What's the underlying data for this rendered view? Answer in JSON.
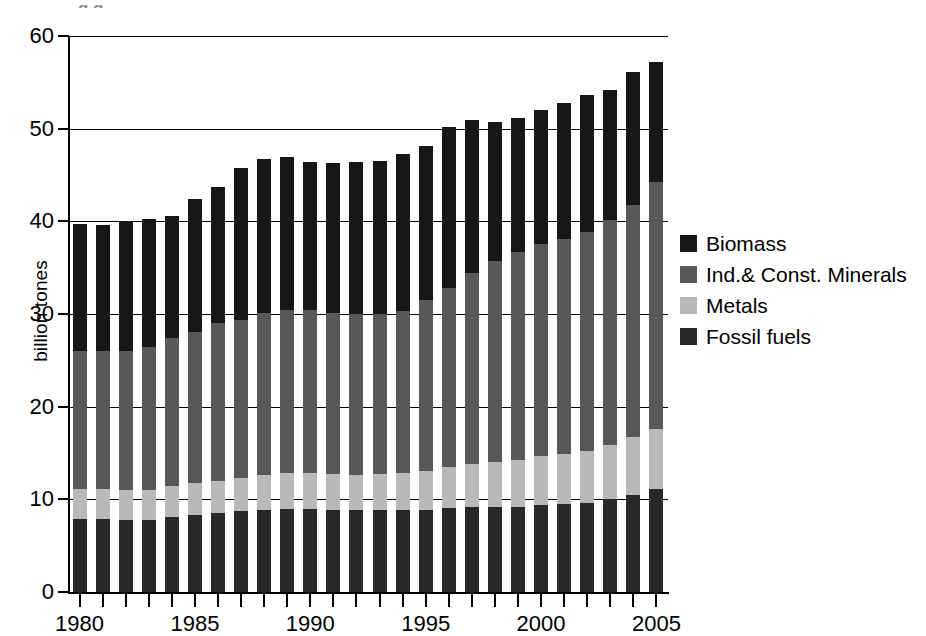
{
  "top_clipped_text": "g                                                                   g",
  "legend": {
    "position": "right",
    "items": [
      {
        "label": "Biomass",
        "color": "#171717",
        "key": "biomass"
      },
      {
        "label": "Ind.& Const. Minerals",
        "color": "#585858",
        "key": "minerals"
      },
      {
        "label": "Metals",
        "color": "#b9b9b9",
        "key": "metals"
      },
      {
        "label": "Fossil fuels",
        "color": "#282828",
        "key": "fossil"
      }
    ]
  },
  "axes": {
    "ylabel": "billion tones",
    "yticks": [
      0,
      10,
      20,
      30,
      40,
      50,
      60
    ],
    "ylim": [
      0,
      60
    ],
    "xlabels": [
      "1980",
      "1985",
      "1990",
      "1995",
      "2000",
      "2005"
    ],
    "xlabel": ""
  },
  "chart_data": {
    "type": "bar",
    "stacked": true,
    "title": "",
    "xlabel": "",
    "ylabel": "billion tones",
    "ylim": [
      0,
      60
    ],
    "grid": true,
    "legend_position": "right",
    "categories": [
      "1980",
      "1981",
      "1982",
      "1983",
      "1984",
      "1985",
      "1986",
      "1987",
      "1988",
      "1989",
      "1990",
      "1991",
      "1992",
      "1993",
      "1994",
      "1995",
      "1996",
      "1997",
      "1998",
      "1999",
      "2000",
      "2001",
      "2002",
      "2003",
      "2004",
      "2005"
    ],
    "stack_order_bottom_to_top": [
      "Fossil fuels",
      "Metals",
      "Ind.& Const. Minerals",
      "Biomass"
    ],
    "series": [
      {
        "name": "Fossil fuels",
        "color": "#282828",
        "values": [
          7.9,
          7.9,
          7.8,
          7.8,
          8.1,
          8.3,
          8.5,
          8.7,
          8.9,
          9.0,
          9.0,
          8.9,
          8.8,
          8.8,
          8.8,
          8.9,
          9.1,
          9.2,
          9.2,
          9.2,
          9.4,
          9.5,
          9.6,
          10.0,
          10.5,
          11.1
        ]
      },
      {
        "name": "Metals",
        "color": "#b9b9b9",
        "values": [
          3.2,
          3.2,
          3.2,
          3.2,
          3.3,
          3.5,
          3.5,
          3.6,
          3.7,
          3.8,
          3.8,
          3.8,
          3.8,
          3.9,
          4.0,
          4.2,
          4.4,
          4.6,
          4.8,
          5.0,
          5.3,
          5.4,
          5.6,
          5.9,
          6.2,
          6.5
        ]
      },
      {
        "name": "Ind.& Const. Minerals",
        "color": "#585858",
        "values": [
          14.9,
          14.9,
          15.0,
          15.4,
          16.0,
          16.3,
          17.0,
          17.1,
          17.5,
          17.6,
          17.6,
          17.4,
          17.4,
          17.3,
          17.5,
          18.4,
          19.3,
          20.6,
          21.7,
          22.5,
          22.9,
          23.2,
          23.6,
          24.2,
          25.1,
          26.6
        ]
      },
      {
        "name": "Biomass",
        "color": "#171717",
        "values": [
          13.7,
          13.6,
          14.0,
          13.8,
          13.2,
          14.3,
          14.7,
          16.4,
          16.6,
          16.5,
          16.0,
          16.2,
          16.4,
          16.5,
          17.0,
          16.6,
          17.4,
          16.5,
          15.0,
          14.4,
          14.4,
          14.7,
          14.8,
          14.1,
          14.3,
          13.0
        ]
      }
    ],
    "totals": [
      39.7,
      39.6,
      40.0,
      40.2,
      40.6,
      42.4,
      43.7,
      45.8,
      46.7,
      46.9,
      46.4,
      46.3,
      46.4,
      46.5,
      47.3,
      48.1,
      50.2,
      50.9,
      50.7,
      51.1,
      52.0,
      52.8,
      53.6,
      54.2,
      56.1,
      57.2
    ]
  }
}
